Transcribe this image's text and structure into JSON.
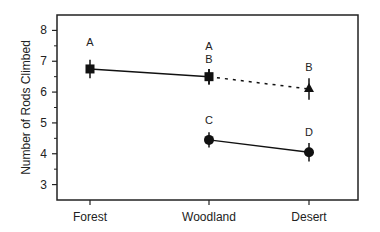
{
  "chart_data": {
    "type": "line",
    "title": "",
    "xlabel": "",
    "ylabel": "Number of Rods Climbed",
    "categories": [
      "Forest",
      "Woodland",
      "Desert"
    ],
    "ylim": [
      2.5,
      8.5
    ],
    "yticks": [
      3,
      4,
      5,
      6,
      7,
      8
    ],
    "grid": false,
    "legend": null,
    "series": [
      {
        "name": "Group 1 (squares)",
        "marker": "square",
        "line_style": "solid",
        "points": [
          {
            "x": "Forest",
            "y": 6.75,
            "err": 0.3,
            "label": "A"
          },
          {
            "x": "Woodland",
            "y": 6.5,
            "err": 0.25,
            "label": "A"
          }
        ]
      },
      {
        "name": "Group 1 to Desert (triangle)",
        "marker": "triangle",
        "line_style": "dotted",
        "points": [
          {
            "x": "Woodland",
            "y": 6.5,
            "err": 0.25,
            "label": "B"
          },
          {
            "x": "Desert",
            "y": 6.1,
            "err": 0.35,
            "label": "B"
          }
        ]
      },
      {
        "name": "Group 2 (circles)",
        "marker": "circle",
        "line_style": "solid",
        "points": [
          {
            "x": "Woodland",
            "y": 4.45,
            "err": 0.25,
            "label": "C"
          },
          {
            "x": "Desert",
            "y": 4.05,
            "err": 0.3,
            "label": "D"
          }
        ]
      }
    ],
    "annotations": [
      "A",
      "A",
      "B",
      "B",
      "C",
      "D"
    ]
  }
}
